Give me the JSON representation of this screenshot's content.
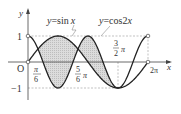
{
  "diagram": {
    "type": "function-graph",
    "curves": [
      {
        "name": "sin",
        "label_y": "y",
        "label_eq": "=sin",
        "label_var": "x"
      },
      {
        "name": "cos2x",
        "label_y": "y",
        "label_eq": "=cos2",
        "label_var": "x"
      }
    ],
    "axes": {
      "x_label": "x",
      "y_label": "y",
      "origin_label": "O",
      "y_ticks": {
        "one": "1",
        "neg_one": "−1"
      }
    },
    "x_tick_labels": {
      "pi6_num": "π",
      "pi6_den": "6",
      "five6_num": "5",
      "five6_den": "6",
      "five6_pi": "π",
      "three2_num": "3",
      "three2_den": "2",
      "three2_pi": "π",
      "two_pi": "2π"
    },
    "shaded_intervals": [
      [
        "pi/6",
        "5pi/6"
      ],
      [
        "5pi/6",
        "3pi/2"
      ]
    ],
    "colors": {
      "curve": "#222222",
      "axis": "#333333",
      "dashed": "#888888",
      "fill": "#d4d4d4"
    }
  }
}
